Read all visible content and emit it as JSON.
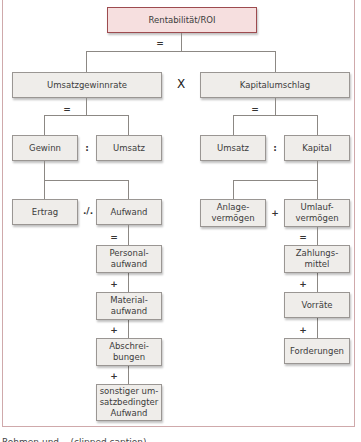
{
  "diagram": {
    "root": "Rentabilität/ROI",
    "level1": {
      "left": "Umsatzgewinnrate",
      "right": "Kapitalumschlag",
      "operator": "X",
      "root_operator": "="
    },
    "level2": {
      "left_operator_eq": "=",
      "right_operator_eq": "=",
      "left_a": "Gewinn",
      "left_b": "Umsatz",
      "left_op": ":",
      "right_a": "Umsatz",
      "right_b": "Kapital",
      "right_op": ":"
    },
    "level3": {
      "left_a": "Ertrag",
      "left_b": "Aufwand",
      "left_op": "./.",
      "right_a": "Anlage-\nvermögen",
      "right_b": "Umlauf-\nvermögen",
      "right_op": "+"
    },
    "aufwand_chain": {
      "first_op": "=",
      "items": [
        "Personal-\naufwand",
        "Material-\naufwand",
        "Abschrei-\nbungen",
        "sonstiger um-\nsatzbedingter\nAufwand"
      ],
      "ops": [
        "+",
        "+",
        "+"
      ]
    },
    "umlauf_chain": {
      "first_op": "=",
      "items": [
        "Zahlungs-\nmittel",
        "Vorräte",
        "Forderungen"
      ],
      "ops": [
        "+",
        "+"
      ]
    }
  },
  "caption": "Rohmen und ...(clipped caption)"
}
